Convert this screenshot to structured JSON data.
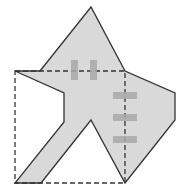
{
  "diagram": {
    "type": "geometry-folding",
    "colors": {
      "shape_fill": "#d9d9d9",
      "outline": "#333333",
      "dashed": "#333333",
      "tape": "#a8a8a8"
    },
    "shape_points": "15,71 40,71 91,7 125,71 175,93 175,120 125,183 91,120 41,183 15,183 64,122 64,93",
    "square": {
      "x": 15,
      "y": 71,
      "width": 110,
      "height": 112
    },
    "tapes": [
      {
        "x": 71,
        "y": 60,
        "w": 7,
        "h": 20
      },
      {
        "x": 90,
        "y": 60,
        "w": 7,
        "h": 20
      },
      {
        "x": 113,
        "y": 92,
        "w": 24,
        "h": 7
      },
      {
        "x": 113,
        "y": 114,
        "w": 24,
        "h": 7
      },
      {
        "x": 113,
        "y": 136,
        "w": 24,
        "h": 7
      }
    ]
  }
}
